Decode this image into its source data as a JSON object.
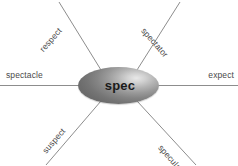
{
  "diagram": {
    "type": "word-web",
    "center": {
      "label": "spec"
    },
    "branches": [
      {
        "id": "spectacle",
        "label": "spectacle",
        "direction": "left",
        "position": "horizontal-left"
      },
      {
        "id": "expect",
        "label": "expect",
        "direction": "right",
        "position": "horizontal-right"
      },
      {
        "id": "respect",
        "label": "respect",
        "direction": "upper-left",
        "position": "diagonal"
      },
      {
        "id": "spectator",
        "label": "spectator",
        "direction": "upper-right",
        "position": "diagonal"
      },
      {
        "id": "suspect",
        "label": "suspect",
        "direction": "lower-left",
        "position": "diagonal"
      },
      {
        "id": "speculate",
        "label": "speculate",
        "direction": "lower-right",
        "position": "diagonal"
      }
    ],
    "colors": {
      "background": "#ffffff",
      "line": "#8d8d8d",
      "label_text": "#4a4a4a",
      "center_text": "#1a1a1a",
      "center_fill_light": "#e8e8e8",
      "center_fill_dark": "#6a6a6a"
    }
  }
}
